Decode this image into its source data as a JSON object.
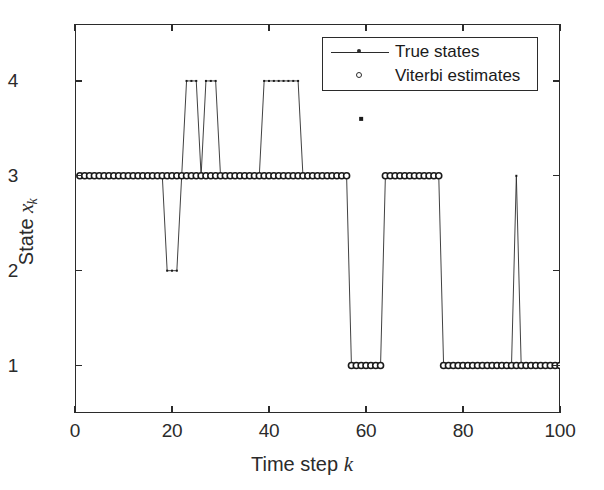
{
  "figure": {
    "background": "#ffffff",
    "line_color": "#2b2b2b",
    "marker_color": "#1a1a1a"
  },
  "axes": {
    "x_ticks": [
      "0",
      "20",
      "40",
      "60",
      "80",
      "100"
    ],
    "x_tick_values": [
      0,
      20,
      40,
      60,
      80,
      100
    ],
    "y_ticks": [
      "1",
      "2",
      "3",
      "4"
    ],
    "y_tick_values": [
      1,
      2,
      3,
      4
    ],
    "xlabel_text": "Time step ",
    "xlabel_var": "k",
    "ylabel_text": "State ",
    "ylabel_var": "x",
    "ylabel_sub": "k"
  },
  "legend": {
    "entries": [
      {
        "label": "True states",
        "marker": "line-dot"
      },
      {
        "label": "Viterbi estimates",
        "marker": "open-circle"
      }
    ]
  },
  "chart_data": {
    "type": "line",
    "title": "",
    "xlabel": "Time step k",
    "ylabel": "State x_k",
    "xlim": [
      0,
      100
    ],
    "ylim": [
      0.5,
      4.6
    ],
    "grid": false,
    "legend_position": "upper-right-inside",
    "x": [
      1,
      2,
      3,
      4,
      5,
      6,
      7,
      8,
      9,
      10,
      11,
      12,
      13,
      14,
      15,
      16,
      17,
      18,
      19,
      20,
      21,
      22,
      23,
      24,
      25,
      26,
      27,
      28,
      29,
      30,
      31,
      32,
      33,
      34,
      35,
      36,
      37,
      38,
      39,
      40,
      41,
      42,
      43,
      44,
      45,
      46,
      47,
      48,
      49,
      50,
      51,
      52,
      53,
      54,
      55,
      56,
      57,
      58,
      59,
      60,
      61,
      62,
      63,
      64,
      65,
      66,
      67,
      68,
      69,
      70,
      71,
      72,
      73,
      74,
      75,
      76,
      77,
      78,
      79,
      80,
      81,
      82,
      83,
      84,
      85,
      86,
      87,
      88,
      89,
      90,
      91,
      92,
      93,
      94,
      95,
      96,
      97,
      98,
      99,
      100
    ],
    "series": [
      {
        "name": "True states",
        "style": "line-with-dot-markers",
        "values": [
          3,
          3,
          3,
          3,
          3,
          3,
          3,
          3,
          3,
          3,
          3,
          3,
          3,
          3,
          3,
          3,
          3,
          3,
          2,
          2,
          2,
          3,
          4,
          4,
          4,
          3,
          4,
          4,
          4,
          3,
          3,
          3,
          3,
          3,
          3,
          3,
          3,
          3,
          4,
          4,
          4,
          4,
          4,
          4,
          4,
          4,
          3,
          3,
          3,
          3,
          3,
          3,
          3,
          3,
          3,
          3,
          1,
          1,
          1,
          1,
          1,
          1,
          1,
          3,
          3,
          3,
          3,
          3,
          3,
          3,
          3,
          3,
          3,
          3,
          3,
          1,
          1,
          1,
          1,
          1,
          1,
          1,
          1,
          1,
          1,
          1,
          1,
          1,
          1,
          1,
          3,
          1,
          1,
          1,
          1,
          1,
          1,
          1,
          1,
          1
        ]
      },
      {
        "name": "Viterbi estimates",
        "style": "open-circle-markers",
        "values": [
          3,
          3,
          3,
          3,
          3,
          3,
          3,
          3,
          3,
          3,
          3,
          3,
          3,
          3,
          3,
          3,
          3,
          3,
          3,
          3,
          3,
          3,
          3,
          3,
          3,
          3,
          3,
          3,
          3,
          3,
          3,
          3,
          3,
          3,
          3,
          3,
          3,
          3,
          3,
          3,
          3,
          3,
          3,
          3,
          3,
          3,
          3,
          3,
          3,
          3,
          3,
          3,
          3,
          3,
          3,
          3,
          1,
          1,
          1,
          1,
          1,
          1,
          1,
          3,
          3,
          3,
          3,
          3,
          3,
          3,
          3,
          3,
          3,
          3,
          3,
          1,
          1,
          1,
          1,
          1,
          1,
          1,
          1,
          1,
          1,
          1,
          1,
          1,
          1,
          1,
          1,
          1,
          1,
          1,
          1,
          1,
          1,
          1,
          1,
          1
        ]
      }
    ],
    "annotations": [
      {
        "name": "stray-marker",
        "x": 59,
        "y": 3.6
      }
    ]
  }
}
